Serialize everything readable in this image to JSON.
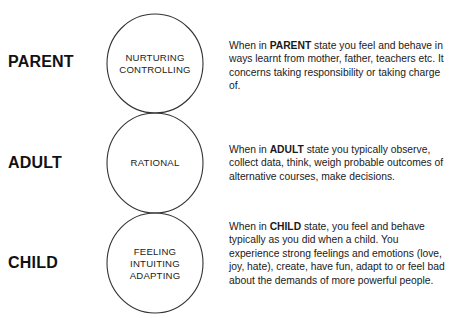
{
  "diagram": {
    "colors": {
      "text": "#111111",
      "circle_stroke": "#333333",
      "background": "#ffffff"
    },
    "states": [
      {
        "label": "PARENT",
        "circle_lines": [
          "NURTURING",
          "CONTROLLING"
        ],
        "desc_prefix": "When in ",
        "desc_bold": "PARENT",
        "desc_rest": " state you feel and behave in ways learnt from mother, father, teachers etc. It concerns taking responsibility or taking charge of."
      },
      {
        "label": "ADULT",
        "circle_lines": [
          "RATIONAL"
        ],
        "desc_prefix": "When in ",
        "desc_bold": "ADULT",
        "desc_rest": " state you typically observe, collect data, think, weigh probable outcomes of alternative courses, make decisions."
      },
      {
        "label": "CHILD",
        "circle_lines": [
          "FEELING",
          "INTUITING",
          "ADAPTING"
        ],
        "desc_prefix": "When in ",
        "desc_bold": "CHILD",
        "desc_rest": " state, you feel and behave typically as you did when a child. You experience strong feelings and emotions (love, joy, hate), create, have fun, adapt to or feel bad about the demands of more powerful people."
      }
    ]
  }
}
